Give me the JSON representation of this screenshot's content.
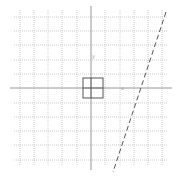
{
  "diagram": {
    "type": "coordinate-plane",
    "grid": {
      "vertical_x": [
        20,
        34,
        48,
        62,
        77,
        105,
        120,
        134,
        148,
        162
      ],
      "horizontal_y": [
        17,
        31,
        45,
        60,
        74,
        103,
        117,
        131,
        145,
        160
      ],
      "extent": {
        "x1": 14,
        "y1": 10,
        "x2": 168,
        "y2": 166
      },
      "color": "#b8b8b8"
    },
    "axes": {
      "x_axis_y": 88,
      "y_axis_x": 91,
      "color": "#8a8a8a"
    },
    "square": {
      "x": 83,
      "y": 78,
      "size": 20,
      "color": "#555555"
    },
    "dashed_line": {
      "x1": 166,
      "y1": 12,
      "x2": 113,
      "y2": 172,
      "color": "#555555"
    },
    "labels": [
      {
        "text": "y",
        "x": 92,
        "y": 58
      },
      {
        "text": "x",
        "x": 121,
        "y": 90
      }
    ]
  }
}
